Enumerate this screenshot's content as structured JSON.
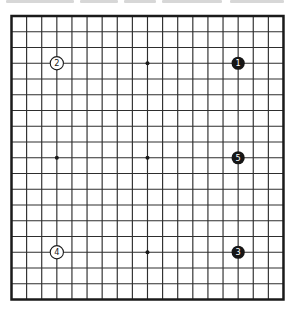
{
  "board": {
    "type": "go-board",
    "board_size": 19,
    "colors": {
      "background": "#ffffff",
      "line": "#2e2e2e",
      "border": "#1a1a1a",
      "star_point": "#1a1a1a",
      "black_stone": "#161616",
      "white_stone": "#ffffff",
      "white_stone_outline": "#1a1a1a",
      "number_on_black": "#ffffff",
      "number_on_white": "#1a1a1a"
    },
    "stones": [
      {
        "number": "1",
        "color": "black",
        "col": 15,
        "row": 3
      },
      {
        "number": "2",
        "color": "white",
        "col": 3,
        "row": 3
      },
      {
        "number": "3",
        "color": "black",
        "col": 15,
        "row": 15
      },
      {
        "number": "4",
        "color": "white",
        "col": 3,
        "row": 15
      },
      {
        "number": "5",
        "color": "black",
        "col": 15,
        "row": 9
      }
    ],
    "star_points": [
      {
        "col": 9,
        "row": 3
      },
      {
        "col": 3,
        "row": 9
      },
      {
        "col": 9,
        "row": 9
      },
      {
        "col": 9,
        "row": 15
      }
    ]
  }
}
